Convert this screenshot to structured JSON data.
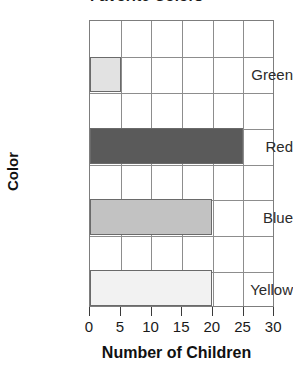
{
  "chart_data": {
    "type": "bar",
    "orientation": "horizontal",
    "title": "Favorite Colors",
    "xlabel": "Number of Children",
    "ylabel": "Color",
    "categories": [
      "Green",
      "Red",
      "Blue",
      "Yellow"
    ],
    "values": [
      5,
      25,
      20,
      20
    ],
    "xlim": [
      0,
      30
    ],
    "xticks": [
      0,
      5,
      10,
      15,
      20,
      25,
      30
    ],
    "xtick_labels": [
      "0",
      "5",
      "10",
      "15",
      "20",
      "25",
      "30"
    ],
    "grid": true,
    "legend": "none",
    "bar_colors": [
      "#e2e2e2",
      "#5a5a5a",
      "#c2c2c2",
      "#f2f2f2"
    ],
    "bar_edge_color": "#6a6a6a",
    "grid_color": "#8d8d8d",
    "axis_color": "#7d7d7d",
    "text_color": "#1a1a1a",
    "background": "#ffffff",
    "note": "Title is cropped at the top edge of the screenshot"
  }
}
